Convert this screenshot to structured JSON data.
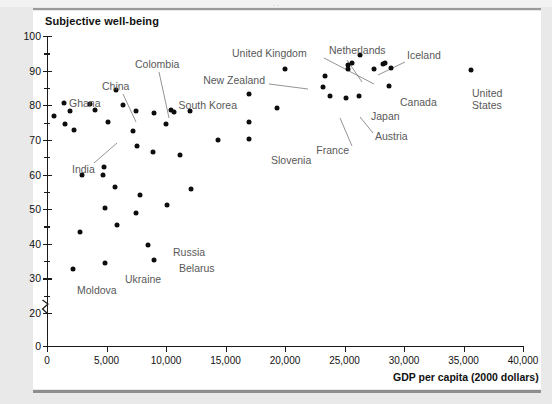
{
  "figure": {
    "panel_bg": "#ffffff",
    "surround_bg": "#e9e9e9",
    "rule_color": "#8e8e8e",
    "ghost_top_text": ". ."
  },
  "chart_data": {
    "type": "scatter",
    "title": "Subjective well-being",
    "xlabel": "GDP per capita (2000 dollars)",
    "ylabel": "Subjective well-being",
    "xlim": [
      0,
      40000
    ],
    "ylim": [
      0,
      100
    ],
    "y_axis_break": {
      "present": true,
      "between": [
        0,
        20
      ]
    },
    "grid": false,
    "legend": "none",
    "xticks": [
      0,
      5000,
      10000,
      15000,
      20000,
      25000,
      30000,
      35000,
      40000
    ],
    "xtick_labels": [
      "0",
      "5,000",
      "10,000",
      "15,000",
      "20,000",
      "25,000",
      "30,000",
      "35,000",
      "40,000"
    ],
    "yticks": [
      0,
      20,
      30,
      40,
      50,
      60,
      70,
      80,
      90,
      100
    ],
    "ytick_labels": [
      "0",
      "20",
      "30",
      "40",
      "50",
      "60",
      "70",
      "80",
      "90",
      "100"
    ],
    "yticks_minor": [
      25,
      35,
      45,
      55,
      65,
      75,
      85,
      95
    ],
    "marker": {
      "shape": "circle",
      "color": "#0d0d0d",
      "size_px": 5
    },
    "points": [
      {
        "x": 600,
        "y": 76.8
      },
      {
        "x": 1400,
        "y": 80.7,
        "label": "Ghana"
      },
      {
        "x": 1500,
        "y": 74.7
      },
      {
        "x": 1950,
        "y": 78.2
      },
      {
        "x": 2300,
        "y": 72.8,
        "label": "India"
      },
      {
        "x": 3600,
        "y": 80.3,
        "label": "China"
      },
      {
        "x": 4000,
        "y": 78.7
      },
      {
        "x": 5800,
        "y": 84.3,
        "label": "Colombia"
      },
      {
        "x": 5100,
        "y": 75.2
      },
      {
        "x": 6400,
        "y": 80.2
      },
      {
        "x": 7500,
        "y": 78.2
      },
      {
        "x": 7200,
        "y": 72.7
      },
      {
        "x": 9000,
        "y": 77.9
      },
      {
        "x": 10000,
        "y": 74.6
      },
      {
        "x": 10400,
        "y": 78.5
      },
      {
        "x": 10700,
        "y": 78.0
      },
      {
        "x": 12000,
        "y": 78.3
      },
      {
        "x": 7600,
        "y": 68.3
      },
      {
        "x": 8900,
        "y": 66.6
      },
      {
        "x": 11200,
        "y": 65.6
      },
      {
        "x": 14400,
        "y": 70.1
      },
      {
        "x": 17000,
        "y": 70.2
      },
      {
        "x": 17000,
        "y": 75.1
      },
      {
        "x": 17000,
        "y": 83.3,
        "label": "South Korea"
      },
      {
        "x": 19300,
        "y": 79.1
      },
      {
        "x": 20000,
        "y": 90.4,
        "label": "New Zealand"
      },
      {
        "x": 23400,
        "y": 88.4,
        "label": "United Kingdom"
      },
      {
        "x": 23200,
        "y": 85.4
      },
      {
        "x": 23800,
        "y": 82.7,
        "label": "France"
      },
      {
        "x": 25100,
        "y": 82.2
      },
      {
        "x": 25300,
        "y": 91.5
      },
      {
        "x": 25300,
        "y": 90.5
      },
      {
        "x": 25600,
        "y": 92.3,
        "label": "Netherlands"
      },
      {
        "x": 26300,
        "y": 94.5,
        "label": "Iceland"
      },
      {
        "x": 26200,
        "y": 82.8,
        "label": "Japan"
      },
      {
        "x": 27500,
        "y": 90.4,
        "label": "Austria"
      },
      {
        "x": 28200,
        "y": 91.8
      },
      {
        "x": 28400,
        "y": 92.1
      },
      {
        "x": 28900,
        "y": 90.7
      },
      {
        "x": 28700,
        "y": 85.7,
        "label": "Canada"
      },
      {
        "x": 35600,
        "y": 90.3,
        "label": "United States"
      },
      {
        "x": 2900,
        "y": 60.0
      },
      {
        "x": 4800,
        "y": 62.2
      },
      {
        "x": 4700,
        "y": 60.0
      },
      {
        "x": 5700,
        "y": 56.4
      },
      {
        "x": 7800,
        "y": 54.0
      },
      {
        "x": 4900,
        "y": 50.4
      },
      {
        "x": 10100,
        "y": 51.3
      },
      {
        "x": 7500,
        "y": 48.9
      },
      {
        "x": 5900,
        "y": 45.5
      },
      {
        "x": 2800,
        "y": 43.3
      },
      {
        "x": 12100,
        "y": 55.9
      },
      {
        "x": 8500,
        "y": 39.7,
        "label": "Russia"
      },
      {
        "x": 9000,
        "y": 35.2,
        "label": "Belarus"
      },
      {
        "x": 4900,
        "y": 34.3,
        "label": "Ukraine"
      },
      {
        "x": 2200,
        "y": 32.7,
        "label": "Moldova"
      }
    ],
    "annotations": [
      {
        "text": "Subjective well-being",
        "role": "plot-title"
      },
      {
        "text": "GDP per capita (2000 dollars)",
        "role": "x-axis-title"
      },
      {
        "text": "Ghana",
        "role": "point-label"
      },
      {
        "text": "India",
        "role": "point-label",
        "leader": true
      },
      {
        "text": "China",
        "role": "point-label",
        "leader": true
      },
      {
        "text": "Colombia",
        "role": "point-label",
        "leader": true
      },
      {
        "text": "South Korea",
        "role": "point-label"
      },
      {
        "text": "United Kingdom",
        "role": "point-label",
        "leader": true
      },
      {
        "text": "New Zealand",
        "role": "point-label",
        "leader": true
      },
      {
        "text": "Netherlands",
        "role": "point-label",
        "leader": true
      },
      {
        "text": "Iceland",
        "role": "point-label",
        "leader": true
      },
      {
        "text": "Canada",
        "role": "point-label"
      },
      {
        "text": "Japan",
        "role": "point-label"
      },
      {
        "text": "Austria",
        "role": "point-label",
        "leader": true
      },
      {
        "text": "France",
        "role": "point-label",
        "leader": true
      },
      {
        "text": "Slovenia",
        "role": "point-label"
      },
      {
        "text": "United States",
        "role": "point-label"
      },
      {
        "text": "Russia",
        "role": "point-label"
      },
      {
        "text": "Belarus",
        "role": "point-label"
      },
      {
        "text": "Ukraine",
        "role": "point-label"
      },
      {
        "text": "Moldova",
        "role": "point-label"
      }
    ]
  },
  "labels_placed": [
    {
      "name": "ghana",
      "text": "Ghana",
      "px": 22,
      "py": 67,
      "align": "l"
    },
    {
      "name": "india",
      "text": "India",
      "px": 25,
      "py": 133,
      "align": "l"
    },
    {
      "name": "china",
      "text": "China",
      "px": 55,
      "py": 50,
      "align": "l"
    },
    {
      "name": "colombia",
      "text": "Colombia",
      "px": 88,
      "py": 28,
      "align": "l"
    },
    {
      "name": "south-korea",
      "text": "South Korea",
      "px": 190,
      "py": 69,
      "align": "r"
    },
    {
      "name": "united-kingdom",
      "text": "United Kingdom",
      "px": 185,
      "py": 17,
      "align": "l"
    },
    {
      "name": "new-zealand",
      "text": "New Zealand",
      "px": 218,
      "py": 44,
      "align": "r"
    },
    {
      "name": "netherlands",
      "text": "Netherlands",
      "px": 282,
      "py": 14,
      "align": "l"
    },
    {
      "name": "iceland",
      "text": "Iceland",
      "px": 360,
      "py": 19,
      "align": "l"
    },
    {
      "name": "canada",
      "text": "Canada",
      "px": 353,
      "py": 66,
      "align": "l"
    },
    {
      "name": "japan",
      "text": "Japan",
      "px": 324,
      "py": 80,
      "align": "l"
    },
    {
      "name": "austria",
      "text": "Austria",
      "px": 328,
      "py": 100,
      "align": "l"
    },
    {
      "name": "france",
      "text": "France",
      "px": 302,
      "py": 114,
      "align": "r"
    },
    {
      "name": "slovenia",
      "text": "Slovenia",
      "px": 224,
      "py": 124,
      "align": "l"
    },
    {
      "name": "russia",
      "text": "Russia",
      "px": 126,
      "py": 216,
      "align": "l"
    },
    {
      "name": "belarus",
      "text": "Belarus",
      "px": 132,
      "py": 232,
      "align": "l"
    },
    {
      "name": "ukraine",
      "text": "Ukraine",
      "px": 78,
      "py": 243,
      "align": "l"
    },
    {
      "name": "moldova",
      "text": "Moldova",
      "px": 30,
      "py": 254,
      "align": "l"
    },
    {
      "name": "united-states",
      "text": "United States",
      "px": 425,
      "py": 63,
      "align": "l",
      "wrap": true
    }
  ]
}
